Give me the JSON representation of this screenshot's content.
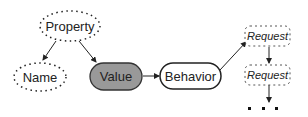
{
  "diagram": {
    "nodes": [
      {
        "id": "property",
        "label": "Property",
        "style": "dotted-ellipse"
      },
      {
        "id": "name",
        "label": "Name",
        "style": "dotted-ellipse"
      },
      {
        "id": "value",
        "label": "Value",
        "style": "filled-rounded"
      },
      {
        "id": "behavior",
        "label": "Behavior",
        "style": "solid-rounded"
      },
      {
        "id": "request1",
        "label": "Request",
        "style": "dashed-italic"
      },
      {
        "id": "request2",
        "label": "Request",
        "style": "dashed-italic"
      }
    ],
    "ellipsis": "...",
    "edges": [
      {
        "from": "property",
        "to": "name"
      },
      {
        "from": "property",
        "to": "value"
      },
      {
        "from": "value",
        "to": "behavior"
      },
      {
        "from": "behavior",
        "to": "request1"
      },
      {
        "from": "request1",
        "to": "request2"
      },
      {
        "from": "request2",
        "to": "ellipsis"
      }
    ]
  }
}
